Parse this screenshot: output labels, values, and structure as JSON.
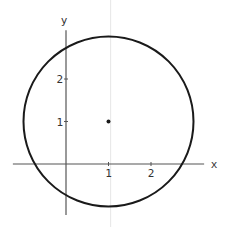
{
  "diagram": {
    "type": "circle-on-cartesian-plane",
    "axes": {
      "x_label": "x",
      "y_label": "y",
      "x_ticks": [
        {
          "value": 1,
          "label": "1"
        },
        {
          "value": 2,
          "label": "2"
        }
      ],
      "y_ticks": [
        {
          "value": 1,
          "label": "1"
        },
        {
          "value": 2,
          "label": "2"
        }
      ],
      "x_range": [
        -1.25,
        3.25
      ],
      "y_range": [
        -1.2,
        3.15
      ]
    },
    "circle": {
      "center": [
        1,
        1
      ],
      "radius": 2
    },
    "center_point": [
      1,
      1
    ],
    "guide_line_x": 1.05,
    "colors": {
      "curve": "#1a1a1a",
      "axis": "#555555",
      "guide": "#e6e6e6",
      "text": "#333333"
    }
  }
}
